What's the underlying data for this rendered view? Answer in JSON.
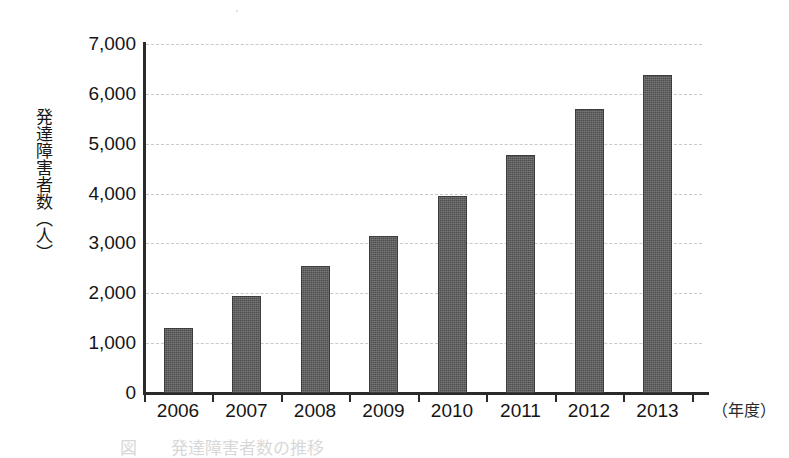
{
  "chart_data": {
    "type": "bar",
    "title": "",
    "xlabel": "（年度）",
    "ylabel": "発達障害者数（人）",
    "categories": [
      "2006",
      "2007",
      "2008",
      "2009",
      "2010",
      "2011",
      "2012",
      "2013"
    ],
    "values": [
      1300,
      1950,
      2550,
      3150,
      3950,
      4780,
      5700,
      6380
    ],
    "ylim": [
      0,
      7000
    ],
    "ytick_values": [
      0,
      1000,
      2000,
      3000,
      4000,
      5000,
      6000,
      7000
    ],
    "ytick_labels": [
      "0",
      "1,000",
      "2,000",
      "3,000",
      "4,000",
      "5,000",
      "6,000",
      "7,000"
    ],
    "grid": true,
    "grid_style": "dashed-horizontal",
    "legend": null,
    "bar_color": "#4e4e4e",
    "axis_color": "#2a2a2a",
    "grid_color": "#c9c9c9",
    "background": "#ffffff"
  },
  "axes": {
    "y_title": "発達障害者数（人）",
    "x_unit_label": "（年度）"
  },
  "caption": {
    "text": "図　　発達障害者数の推移",
    "visible": "clipped"
  }
}
